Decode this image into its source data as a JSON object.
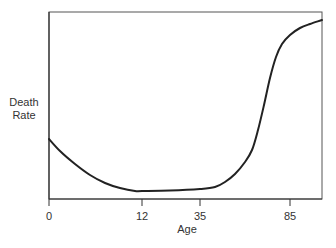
{
  "chart_data": {
    "type": "line",
    "title": "",
    "xlabel": "Age",
    "ylabel": "Death Rate",
    "ylabel_lines": [
      "Death",
      "Rate"
    ],
    "x_ticks": [
      {
        "label": "0",
        "px": 49
      },
      {
        "label": "12",
        "px": 142
      },
      {
        "label": "35",
        "px": 200
      },
      {
        "label": "85",
        "px": 290
      }
    ],
    "y_ticks": [],
    "grid": false,
    "legend": null,
    "ylim": [
      0,
      100
    ],
    "series": [
      {
        "name": "Death Rate",
        "color": "#222222",
        "points_px": [
          [
            49,
            139
          ],
          [
            60,
            151
          ],
          [
            75,
            164
          ],
          [
            90,
            175
          ],
          [
            105,
            183
          ],
          [
            120,
            188
          ],
          [
            135,
            191
          ],
          [
            142,
            191
          ],
          [
            170,
            190.5
          ],
          [
            200,
            189
          ],
          [
            215,
            187
          ],
          [
            225,
            182
          ],
          [
            235,
            174
          ],
          [
            245,
            162
          ],
          [
            252,
            150
          ],
          [
            258,
            130
          ],
          [
            264,
            105
          ],
          [
            270,
            78
          ],
          [
            276,
            57
          ],
          [
            282,
            44
          ],
          [
            290,
            35
          ],
          [
            300,
            28
          ],
          [
            310,
            24
          ],
          [
            322,
            20
          ]
        ],
        "approx_values": [
          {
            "age": 0,
            "rate": 32
          },
          {
            "age": 12,
            "rate": 4
          },
          {
            "age": 35,
            "rate": 5
          },
          {
            "age": 60,
            "rate": 26
          },
          {
            "age": 85,
            "rate": 88
          },
          {
            "age": 100,
            "rate": 96
          }
        ]
      }
    ],
    "plot_area_px": {
      "left": 49,
      "top": 12,
      "right": 322,
      "bottom": 199
    }
  }
}
